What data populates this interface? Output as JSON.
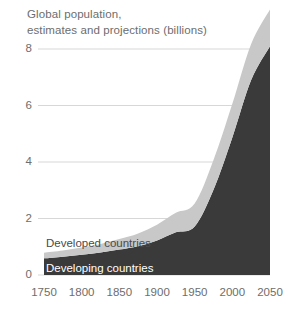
{
  "chart_data": {
    "type": "area",
    "title": "Global population, estimates and projections (billions)",
    "title_lines": [
      "Global population,",
      "estimates and projections (billions)"
    ],
    "xlabel": "",
    "ylabel": "",
    "ylim": [
      0,
      10
    ],
    "xlim": [
      1750,
      2050
    ],
    "grid": true,
    "legend_position": "inline-on-bands",
    "stacked": true,
    "ytick_labels": [
      "0",
      "2",
      "4",
      "6",
      "8"
    ],
    "ytick_values": [
      0,
      2,
      4,
      6,
      8
    ],
    "xtick_labels": [
      "1750",
      "1800",
      "1850",
      "1900",
      "1950",
      "2000",
      "2050"
    ],
    "xtick_values": [
      1750,
      1800,
      1850,
      1900,
      1950,
      2000,
      2050
    ],
    "x": [
      1750,
      1775,
      1800,
      1825,
      1850,
      1875,
      1900,
      1925,
      1950,
      1975,
      2000,
      2025,
      2050
    ],
    "series": [
      {
        "name": "Developing countries",
        "color": "#3a3a3a",
        "label_color": "#ffffff",
        "values": [
          0.59,
          0.65,
          0.72,
          0.8,
          0.9,
          1.02,
          1.22,
          1.51,
          1.72,
          3.02,
          4.87,
          6.9,
          8.1
        ]
      },
      {
        "name": "Developed countries",
        "color": "#c8c8c8",
        "label_color": "#4a4a4a",
        "values": [
          0.2,
          0.22,
          0.25,
          0.3,
          0.37,
          0.45,
          0.56,
          0.69,
          0.81,
          1.05,
          1.19,
          1.28,
          1.3
        ]
      }
    ],
    "totals": [
      0.79,
      0.87,
      0.97,
      1.1,
      1.27,
      1.47,
      1.78,
      2.2,
      2.53,
      4.07,
      6.06,
      8.18,
      9.4
    ]
  },
  "axis": {
    "gridline_color": "#d2d2d2",
    "tick_text_color": "#6d6d6d"
  },
  "labels": {
    "developed": "Developed countries",
    "developing": "Developing countries"
  }
}
